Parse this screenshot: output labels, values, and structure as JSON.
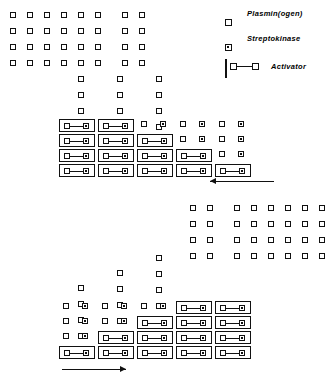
{
  "figure": {
    "title": "",
    "width": 331,
    "height": 390,
    "background": "#ffffff",
    "ink": "#111111"
  },
  "legend": {
    "items": [
      {
        "symbol": "open-square",
        "label": "Plasmin(ogen)"
      },
      {
        "symbol": "dotted-square",
        "label": "Streptokinase"
      },
      {
        "symbol": "activator-complex",
        "label": "Activator"
      }
    ]
  },
  "panels": [
    {
      "id": "top",
      "arrow": {
        "direction": "left",
        "label": "",
        "x": 210,
        "y": 178,
        "width": 64
      },
      "free_plasminogen_columns": [
        {
          "x": 10,
          "rows": 4
        },
        {
          "x": 27,
          "rows": 4
        },
        {
          "x": 44,
          "rows": 4
        },
        {
          "x": 61,
          "rows": 4
        },
        {
          "x": 78,
          "rows": 4
        },
        {
          "x": 95,
          "rows": 4
        },
        {
          "x": 122,
          "rows": 4
        },
        {
          "x": 139,
          "rows": 4
        }
      ],
      "stair_columns": [
        {
          "x": 78,
          "extra_rows": 4
        },
        {
          "x": 117,
          "extra_rows": 4
        },
        {
          "x": 156,
          "extra_rows": 4
        }
      ],
      "activator_groups": [
        {
          "x": 59,
          "count": 4
        },
        {
          "x": 98,
          "count": 4
        },
        {
          "x": 137,
          "count": 3
        },
        {
          "x": 176,
          "count": 2
        },
        {
          "x": 215,
          "count": 1
        }
      ]
    },
    {
      "id": "bottom",
      "arrow": {
        "direction": "right",
        "label": "",
        "x": 62,
        "y": 366,
        "width": 64
      },
      "free_plasminogen_columns": [
        {
          "x": 190,
          "rows": 4
        },
        {
          "x": 207,
          "rows": 4
        },
        {
          "x": 234,
          "rows": 4
        },
        {
          "x": 251,
          "rows": 4
        },
        {
          "x": 268,
          "rows": 4
        },
        {
          "x": 285,
          "rows": 4
        },
        {
          "x": 302,
          "rows": 4
        },
        {
          "x": 319,
          "rows": 4
        }
      ],
      "stair_columns": [
        {
          "x": 78,
          "extra_rows": 4
        },
        {
          "x": 117,
          "extra_rows": 4
        },
        {
          "x": 156,
          "extra_rows": 4
        }
      ],
      "activator_groups": [
        {
          "x": 59,
          "count": 1
        },
        {
          "x": 98,
          "count": 2
        },
        {
          "x": 137,
          "count": 3
        },
        {
          "x": 176,
          "count": 4
        },
        {
          "x": 215,
          "count": 4
        }
      ]
    }
  ],
  "geometry": {
    "top_grid_y0": 12,
    "row_pitch": 16,
    "activator_pitch": 15,
    "top_activator_bottom": 178,
    "bottom_activator_bottom": 360,
    "bottom_grid_y0": 205
  }
}
